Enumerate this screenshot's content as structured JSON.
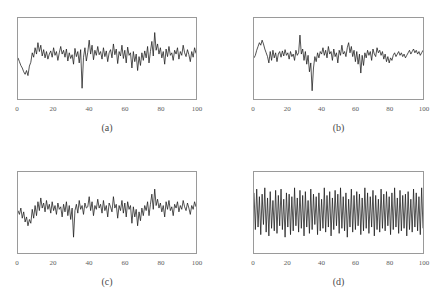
{
  "figure": {
    "background": "#ffffff",
    "line_color": "#1a1a1a",
    "frame_color": "#9a9a9a",
    "tick_label_color": "#5d5d5d",
    "caption_color": "#4a4a4a"
  },
  "panels": [
    {
      "caption": "(a)",
      "chart_data": {
        "type": "line",
        "title": "(a)",
        "xlabel": "",
        "ylabel": "",
        "xlim": [
          0,
          100
        ],
        "ylim": [
          -3.2,
          3.2
        ],
        "grid": false,
        "legend": "none",
        "xticks": [
          0,
          20,
          40,
          60,
          80,
          100
        ],
        "xtick_labels": [
          "0",
          "20",
          "40",
          "60",
          "80",
          "100"
        ],
        "series": [
          {
            "name": "signal-a",
            "x_start": 0,
            "x_end": 100,
            "values": [
              0.05,
              -0.25,
              -0.55,
              -0.75,
              -1.05,
              -1.25,
              -0.95,
              -1.35,
              -0.6,
              -0.3,
              0.45,
              0.1,
              0.85,
              0.35,
              1.25,
              0.55,
              1.05,
              0.2,
              0.7,
              0.05,
              0.55,
              -0.05,
              0.35,
              0.6,
              0.1,
              0.85,
              0.25,
              0.55,
              -0.15,
              0.45,
              0.95,
              0.35,
              0.65,
              0.1,
              0.75,
              -0.2,
              0.45,
              0.0,
              0.3,
              -0.45,
              0.8,
              0.15,
              0.55,
              -0.35,
              0.7,
              -2.35,
              0.1,
              0.85,
              -0.2,
              0.5,
              1.45,
              0.35,
              1.05,
              -0.1,
              0.65,
              0.25,
              0.95,
              0.3,
              0.55,
              -0.05,
              0.85,
              0.15,
              0.6,
              -0.25,
              0.45,
              0.7,
              0.05,
              1.15,
              0.3,
              0.75,
              -0.4,
              0.55,
              0.2,
              1.05,
              0.0,
              0.65,
              -0.35,
              0.9,
              0.25,
              0.45,
              -0.75,
              0.55,
              -0.25,
              0.35,
              -0.95,
              0.15,
              -0.55,
              0.45,
              -0.15,
              0.6,
              0.05,
              0.95,
              -0.35,
              0.55,
              1.35,
              0.2,
              2.05,
              0.65,
              1.15,
              0.35,
              0.85,
              0.05,
              0.55,
              -0.45,
              0.75,
              0.15,
              0.95,
              0.25,
              0.45,
              -0.15,
              0.65,
              0.35,
              0.85,
              -0.05,
              0.55,
              0.25,
              1.05,
              0.45,
              0.15,
              0.7,
              0.3,
              -0.25,
              0.55,
              0.1,
              0.85,
              0.4
            ]
          }
        ]
      }
    },
    {
      "caption": "(b)",
      "chart_data": {
        "type": "line",
        "title": "(b)",
        "xlabel": "",
        "ylabel": "",
        "xlim": [
          0,
          100
        ],
        "ylim": [
          -3.2,
          3.2
        ],
        "grid": false,
        "legend": "none",
        "xticks": [
          0,
          20,
          40,
          60,
          80,
          100
        ],
        "xtick_labels": [
          "0",
          "20",
          "40",
          "60",
          "80",
          "100"
        ],
        "series": [
          {
            "name": "signal-b",
            "x_start": 0,
            "x_end": 100,
            "values": [
              0.05,
              0.25,
              0.65,
              0.95,
              1.25,
              1.05,
              1.45,
              1.15,
              0.75,
              0.45,
              0.15,
              -0.35,
              0.55,
              -0.15,
              0.65,
              0.05,
              0.45,
              -0.25,
              0.35,
              0.55,
              0.1,
              0.6,
              0.2,
              0.7,
              0.25,
              0.45,
              -0.05,
              0.55,
              0.15,
              0.35,
              -0.15,
              0.65,
              0.25,
              0.45,
              1.85,
              0.35,
              0.75,
              -0.15,
              0.55,
              -0.45,
              0.25,
              -1.05,
              -0.35,
              -2.55,
              -0.75,
              0.15,
              -0.25,
              0.45,
              0.05,
              0.55,
              0.35,
              0.85,
              0.25,
              0.65,
              0.05,
              0.95,
              0.35,
              0.55,
              -0.15,
              0.75,
              0.15,
              0.45,
              -0.35,
              0.65,
              0.25,
              1.05,
              0.35,
              0.55,
              0.15,
              0.85,
              1.25,
              0.45,
              0.95,
              0.15,
              0.65,
              -0.25,
              0.55,
              -0.45,
              0.35,
              -1.15,
              0.25,
              -0.55,
              0.45,
              0.05,
              0.65,
              0.25,
              0.55,
              -0.15,
              0.75,
              0.35,
              0.15,
              0.85,
              0.45,
              0.65,
              0.25,
              0.55,
              -0.05,
              0.35,
              -0.25,
              0.15,
              -0.35,
              0.05,
              -0.15,
              0.25,
              0.45,
              0.15,
              0.35,
              0.55,
              0.25,
              0.45,
              0.15,
              0.35,
              0.05,
              0.25,
              0.45,
              0.65,
              0.35,
              0.55,
              0.75,
              0.45,
              0.65,
              0.35,
              0.55,
              0.25,
              0.45,
              0.65
            ]
          }
        ]
      }
    },
    {
      "caption": "(c)",
      "chart_data": {
        "type": "line",
        "title": "(c)",
        "xlabel": "",
        "ylabel": "",
        "xlim": [
          0,
          100
        ],
        "ylim": [
          -3.2,
          3.2
        ],
        "grid": false,
        "legend": "none",
        "xticks": [
          0,
          20,
          40,
          60,
          80,
          100
        ],
        "xtick_labels": [
          "0",
          "20",
          "40",
          "60",
          "80",
          "100"
        ],
        "series": [
          {
            "name": "signal-c",
            "x_start": 0,
            "x_end": 100,
            "values": [
              0.15,
              -0.15,
              0.35,
              -0.45,
              0.05,
              -0.75,
              -0.35,
              -1.05,
              -0.55,
              -0.85,
              0.25,
              -0.45,
              0.55,
              -0.25,
              0.85,
              0.15,
              1.15,
              0.35,
              0.75,
              0.05,
              0.95,
              0.25,
              0.65,
              -0.05,
              0.85,
              0.15,
              0.55,
              -0.15,
              0.75,
              0.25,
              0.45,
              -0.35,
              0.65,
              0.05,
              0.85,
              -0.25,
              0.55,
              -0.55,
              0.35,
              -1.95,
              0.15,
              0.65,
              -0.05,
              0.95,
              0.25,
              0.55,
              -0.15,
              0.75,
              0.35,
              0.45,
              1.25,
              0.15,
              0.85,
              -0.25,
              0.55,
              0.25,
              1.05,
              0.35,
              0.65,
              -0.05,
              0.95,
              0.15,
              0.55,
              -0.35,
              0.75,
              0.45,
              0.05,
              1.25,
              0.35,
              0.65,
              -0.45,
              0.55,
              0.15,
              0.95,
              -0.05,
              0.75,
              -0.35,
              0.85,
              0.25,
              0.55,
              -0.85,
              0.45,
              -0.35,
              0.25,
              -1.05,
              0.05,
              -0.65,
              0.35,
              -0.25,
              0.55,
              0.15,
              0.85,
              -0.25,
              0.65,
              1.45,
              0.25,
              1.85,
              0.55,
              1.05,
              0.35,
              0.75,
              0.05,
              0.55,
              -0.35,
              0.85,
              0.25,
              0.95,
              0.15,
              0.45,
              -0.25,
              0.65,
              0.35,
              0.85,
              0.05,
              0.55,
              0.25,
              0.95,
              0.45,
              0.15,
              0.75,
              0.35,
              -0.15,
              0.55,
              0.25,
              0.85,
              0.45
            ]
          }
        ]
      }
    },
    {
      "caption": "(d)",
      "chart_data": {
        "type": "line",
        "title": "(d)",
        "xlabel": "",
        "ylabel": "",
        "xlim": [
          0,
          100
        ],
        "ylim": [
          -3.2,
          3.2
        ],
        "grid": false,
        "legend": "none",
        "xticks": [
          0,
          20,
          40,
          60,
          80,
          100
        ],
        "xtick_labels": [
          "0",
          "20",
          "40",
          "60",
          "80",
          "100"
        ],
        "note": "high-frequency oscillation, alternating sign each sample",
        "series": [
          {
            "name": "signal-d",
            "x_start": 0,
            "x_end": 100,
            "values": [
              1.55,
              -1.35,
              1.85,
              -1.15,
              1.25,
              -1.75,
              1.45,
              -0.95,
              1.95,
              -1.55,
              1.15,
              -1.85,
              1.65,
              -1.25,
              0.95,
              -1.45,
              1.75,
              -1.65,
              1.35,
              -1.05,
              1.85,
              -1.35,
              1.05,
              -1.95,
              1.55,
              -1.15,
              1.45,
              -1.75,
              1.25,
              -1.45,
              1.95,
              -1.05,
              1.15,
              -1.55,
              1.75,
              -1.25,
              1.35,
              -1.85,
              1.65,
              -1.15,
              0.95,
              -1.65,
              1.85,
              -1.35,
              1.45,
              -0.95,
              1.25,
              -1.75,
              1.55,
              -1.45,
              1.05,
              -1.25,
              1.95,
              -1.55,
              1.35,
              -1.15,
              1.65,
              -1.85,
              1.15,
              -1.35,
              1.75,
              -1.05,
              1.45,
              -1.65,
              1.95,
              -1.25,
              1.25,
              -1.45,
              1.55,
              -1.95,
              1.05,
              -1.15,
              1.85,
              -1.55,
              1.35,
              -1.35,
              1.65,
              -1.05,
              1.45,
              -1.75,
              1.15,
              -1.45,
              1.95,
              -1.25,
              1.55,
              -1.65,
              1.25,
              -1.15,
              1.75,
              -1.85,
              1.35,
              -1.35,
              1.05,
              -1.55,
              1.85,
              -1.25,
              1.45,
              -1.45,
              1.65,
              -1.05,
              1.25,
              -1.75,
              1.55,
              -1.35,
              1.95,
              -1.15,
              1.15,
              -1.65,
              1.75,
              -1.45,
              1.35,
              -1.25,
              1.45,
              -1.85,
              1.65,
              -1.35,
              1.05,
              -1.55,
              1.85,
              -1.15,
              1.55,
              -1.45,
              1.25,
              -1.75,
              1.95,
              -1.25
            ]
          }
        ]
      }
    }
  ]
}
